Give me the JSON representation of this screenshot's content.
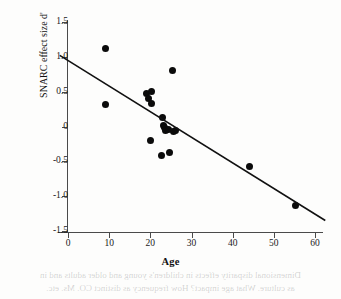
{
  "chart_data": {
    "type": "scatter",
    "title": "",
    "xlabel": "Age",
    "ylabel": "SNARC effect size d'",
    "xlim": [
      0,
      60
    ],
    "ylim": [
      -1.5,
      1.5
    ],
    "grid": false,
    "legend": null,
    "x_ticks": [
      "0",
      "10",
      "20",
      "30",
      "40",
      "50",
      "60"
    ],
    "x_tick_values": [
      0,
      10,
      20,
      30,
      40,
      50,
      60
    ],
    "y_ticks": [
      "1.5",
      "1.0",
      "0.5",
      "0",
      "-0.5",
      "-1.0",
      "-1.5"
    ],
    "y_tick_values": [
      1.5,
      1.0,
      0.5,
      0,
      -0.5,
      -1.0,
      -1.5
    ],
    "point_color": "#0b0b0b",
    "line_color": "#111111",
    "axis_color": "#4a4a4a",
    "points": [
      {
        "x": 9.0,
        "y": 1.12
      },
      {
        "x": 9.2,
        "y": 0.31
      },
      {
        "x": 19.0,
        "y": 0.48
      },
      {
        "x": 20.2,
        "y": 0.5
      },
      {
        "x": 19.6,
        "y": 0.4
      },
      {
        "x": 20.3,
        "y": 0.33
      },
      {
        "x": 25.3,
        "y": 0.8
      },
      {
        "x": 23.0,
        "y": 0.13
      },
      {
        "x": 23.2,
        "y": 0.02
      },
      {
        "x": 23.4,
        "y": -0.02
      },
      {
        "x": 23.6,
        "y": -0.06
      },
      {
        "x": 24.3,
        "y": -0.05
      },
      {
        "x": 25.7,
        "y": -0.07
      },
      {
        "x": 26.0,
        "y": -0.06
      },
      {
        "x": 20.0,
        "y": -0.2
      },
      {
        "x": 22.8,
        "y": -0.41
      },
      {
        "x": 24.6,
        "y": -0.37
      },
      {
        "x": 44.0,
        "y": -0.58
      },
      {
        "x": 55.2,
        "y": -1.14
      }
    ],
    "regression_line": {
      "x_start": -2.0,
      "y_start": 1.02,
      "x_end": 62.5,
      "y_end": -1.35,
      "slope": -0.0367,
      "intercept": 0.947
    }
  },
  "page_bleed": {
    "line1": "Dimensional disparity effects in children's young and older adults and in",
    "line2": "as culture. What age impact? How frequency as distinct CO. Ms. etc."
  }
}
